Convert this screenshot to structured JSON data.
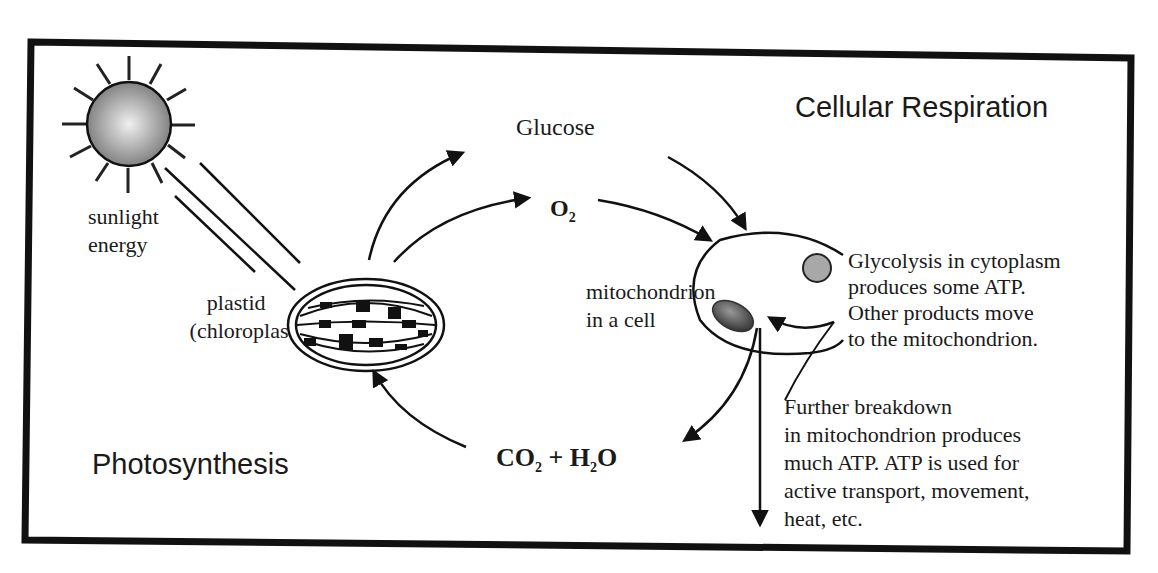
{
  "diagram": {
    "titles": {
      "photosynthesis": "Photosynthesis",
      "cellular_respiration": "Cellular Respiration"
    },
    "labels": {
      "sunlight": [
        "sunlight",
        "energy"
      ],
      "plastid": [
        "plastid",
        "(chloroplast)"
      ],
      "glucose": "Glucose",
      "oxygen": {
        "base": "O",
        "sub": "2"
      },
      "co2_h2o": {
        "c": "CO",
        "c_sub": "2",
        "plus": " + H",
        "h_sub": "2",
        "o": "O"
      },
      "mitochondrion": [
        "mitochondrion",
        "in a cell"
      ],
      "glycolysis": [
        "Glycolysis in cytoplasm",
        "produces some ATP.",
        "Other products move",
        "to the mitochondrion."
      ],
      "further_breakdown": [
        "Further breakdown",
        "in mitochondrion produces",
        "much ATP.  ATP is used for",
        "active transport, movement,",
        "heat, etc."
      ]
    },
    "icons": {
      "sun": "sun-icon",
      "chloroplast": "chloroplast-icon",
      "cell": "cell-icon",
      "mitochondrion": "mitochondrion-icon",
      "cytoplasm": "cytoplasm-granule-icon"
    },
    "colors": {
      "line": "#111111",
      "sun_center": "#e8e8e8",
      "sun_edge": "#7a7a7a",
      "granule": "#a8a8a8",
      "mitochondrion": "#555555"
    }
  }
}
